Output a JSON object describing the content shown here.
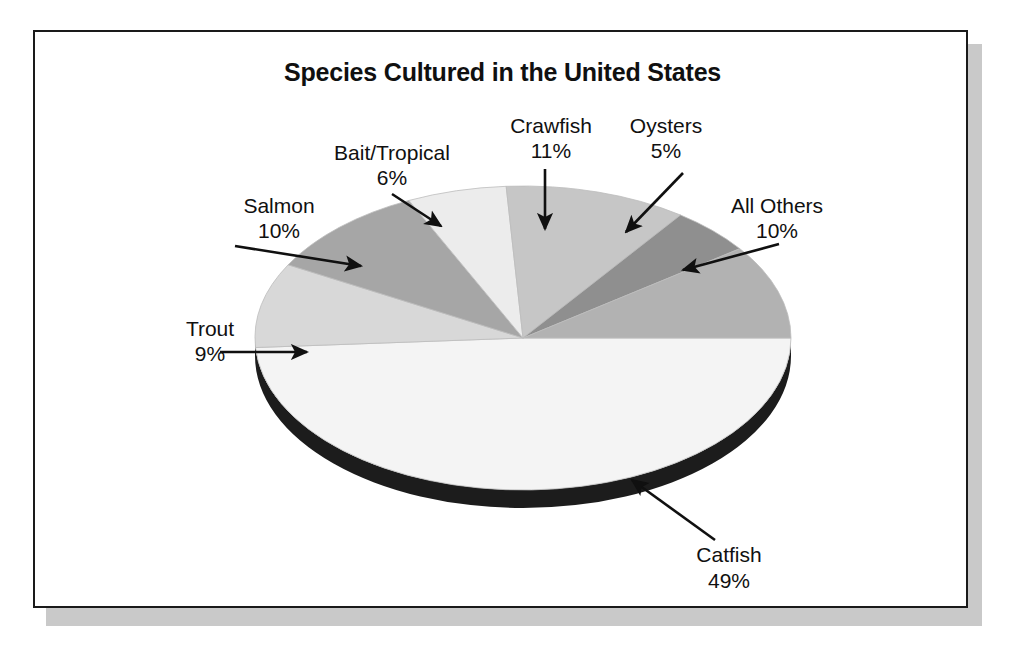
{
  "figure": {
    "title": "Species Cultured in the United States"
  },
  "chart_data": {
    "type": "pie",
    "title": "Species Cultured in the United States",
    "xlabel": "",
    "ylabel": "",
    "unit": "percent",
    "style": "3d-pie-exploded-none",
    "legend_position": "none (labels with leader arrows)",
    "total": 100,
    "categories": [
      "Catfish",
      "Crawfish",
      "Salmon",
      "All Others",
      "Trout",
      "Bait/Tropical",
      "Oysters"
    ],
    "values": [
      49,
      11,
      10,
      10,
      9,
      6,
      5
    ],
    "slices": [
      {
        "label": "Catfish",
        "value": 49,
        "value_text": "49%",
        "color": "#f4f4f4",
        "start_deg": 0,
        "end_deg": 176.4,
        "label_x": 694,
        "label_y": 530,
        "label2_y": 556,
        "label_anchor": "middle",
        "arrow_from_x": 680,
        "arrow_from_y": 508,
        "arrow_to_x": 597,
        "arrow_to_y": 448
      },
      {
        "label": "Crawfish",
        "value": 11,
        "value_text": "11%",
        "color": "#c6c6c6",
        "start_deg": 241.2,
        "end_deg": 280.8,
        "label_x": 516,
        "label_y": 101,
        "label2_y": 126,
        "label_anchor": "middle",
        "arrow_from_x": 510,
        "arrow_from_y": 137,
        "arrow_to_x": 510,
        "arrow_to_y": 197
      },
      {
        "label": "Salmon",
        "value": 10,
        "value_text": "10%",
        "color": "#a6a6a6",
        "start_deg": 176.4,
        "end_deg": 212.4,
        "label_x": 244,
        "label_y": 181,
        "label2_y": 206,
        "label_anchor": "middle",
        "arrow_from_x": 200,
        "arrow_from_y": 214,
        "arrow_to_x": 326,
        "arrow_to_y": 234
      },
      {
        "label": "All Others",
        "value": 10,
        "value_text": "10%",
        "color": "#b2b2b2",
        "start_deg": 324,
        "end_deg": 360,
        "label_x": 742,
        "label_y": 181,
        "label2_y": 206,
        "label_anchor": "middle",
        "arrow_from_x": 744,
        "arrow_from_y": 212,
        "arrow_to_x": 648,
        "arrow_to_y": 238
      },
      {
        "label": "Trout",
        "value": 9,
        "value_text": "9%",
        "color": "#d8d8d8",
        "start_deg": 180,
        "end_deg": 176.4,
        "label_x": 175,
        "label_y": 304,
        "label2_y": 329,
        "label_anchor": "middle",
        "arrow_from_x": 185,
        "arrow_from_y": 320,
        "arrow_to_x": 272,
        "arrow_to_y": 320
      },
      {
        "label": "Bait/Tropical",
        "value": 6,
        "value_text": "6%",
        "color": "#ececec",
        "start_deg": 219.6,
        "end_deg": 241.2,
        "label_x": 357,
        "label_y": 128,
        "label2_y": 153,
        "label_anchor": "middle",
        "arrow_from_x": 357,
        "arrow_from_y": 162,
        "arrow_to_x": 406,
        "arrow_to_y": 194
      },
      {
        "label": "Oysters",
        "value": 5,
        "value_text": "5%",
        "color": "#8f8f8f",
        "start_deg": 280.8,
        "end_deg": 324,
        "label_x": 631,
        "label_y": 101,
        "label2_y": 126,
        "label_anchor": "middle",
        "arrow_from_x": 648,
        "arrow_from_y": 141,
        "arrow_to_x": 591,
        "arrow_to_y": 200
      }
    ],
    "colors": {
      "catfish": "#f4f4f4",
      "crawfish": "#c6c6c6",
      "salmon": "#a6a6a6",
      "all_others": "#b2b2b2",
      "trout": "#d8d8d8",
      "bait_tropical": "#ececec",
      "oysters": "#8f8f8f",
      "pie_side_3d": "#1c1c1c",
      "frame_border": "#1a1a1a",
      "page_shadow": "#c9c9c9",
      "text": "#101010"
    }
  }
}
